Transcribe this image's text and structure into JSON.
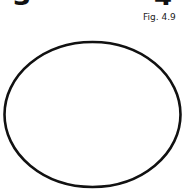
{
  "labels": {
    "left_number": "3",
    "right_number": "4",
    "caption": "Fig. 4.9"
  },
  "shape": {
    "type": "ellipse",
    "cx": 92.5,
    "cy": 114.5,
    "rx": 88,
    "ry": 72.5,
    "stroke": "#111111",
    "stroke_width": 2.6,
    "fill": "#ffffff"
  },
  "colors": {
    "background": "#ffffff",
    "ink": "#111111"
  }
}
